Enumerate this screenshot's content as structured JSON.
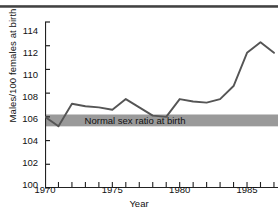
{
  "chart_data": {
    "type": "line",
    "title": "",
    "xlabel": "Year",
    "ylabel": "Males/100 females at birth",
    "xlim": [
      1970,
      1987.3
    ],
    "ylim": [
      100,
      114
    ],
    "yticks": [
      100,
      102,
      104,
      106,
      108,
      110,
      112,
      114
    ],
    "ytick_labels": [
      "100",
      "102",
      "104",
      "106",
      "108",
      "110",
      "112",
      "114"
    ],
    "xticks": [
      1970,
      1971,
      1972,
      1973,
      1974,
      1975,
      1976,
      1977,
      1978,
      1979,
      1980,
      1981,
      1982,
      1983,
      1984,
      1985,
      1986,
      1987
    ],
    "xtick_labels_major": [
      "1970",
      "1975",
      "1980",
      "1985"
    ],
    "xticks_major": [
      1970,
      1975,
      1980,
      1985
    ],
    "grid": false,
    "legend": false,
    "x": [
      1970,
      1971,
      1972,
      1973,
      1974,
      1975,
      1976,
      1977,
      1978,
      1979,
      1980,
      1981,
      1982,
      1983,
      1984,
      1985,
      1986,
      1987
    ],
    "values": [
      106.0,
      105.2,
      107.1,
      106.9,
      106.8,
      106.6,
      107.5,
      106.8,
      106.1,
      106.0,
      107.5,
      107.3,
      107.2,
      107.5,
      108.6,
      111.4,
      112.3,
      111.4
    ],
    "series": [
      {
        "name": "Males/100 females at birth",
        "color": "#555555",
        "values": [
          106.0,
          105.2,
          107.1,
          106.9,
          106.8,
          106.6,
          107.5,
          106.8,
          106.1,
          106.0,
          107.5,
          107.3,
          107.2,
          107.5,
          108.6,
          111.4,
          112.3,
          111.4
        ]
      }
    ],
    "bands": [
      {
        "label": "Normal sex ratio at birth",
        "y_min": 105.2,
        "y_max": 106.2,
        "color": "#9a9a9a"
      }
    ],
    "axis_color": "#222222",
    "background": "#ffffff"
  }
}
